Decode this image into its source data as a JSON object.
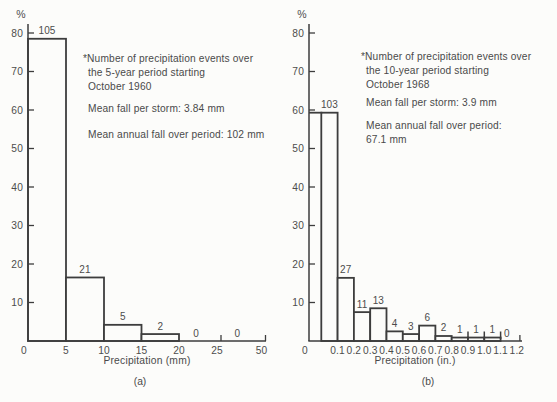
{
  "figure": {
    "background": "#fcfcfa",
    "line_color": "#3d3d3d",
    "text_color": "#4c4c4c"
  },
  "chart_data": [
    {
      "type": "bar",
      "panel": "a",
      "caption": "(a)",
      "y_unit_label": "%",
      "xlabel": "Precipitation (mm)",
      "ylim": [
        0,
        80
      ],
      "yticks": [
        10,
        20,
        30,
        40,
        50,
        60,
        70,
        80
      ],
      "origin_label": "0",
      "xtick_labels": [
        "5",
        "10",
        "15",
        "20",
        "25",
        "50"
      ],
      "axis_note": "x-axis compressed between 25 and 50",
      "bins": [
        {
          "range": "0-5",
          "count": 105,
          "pct": 78.5
        },
        {
          "range": "5-10",
          "count": 21,
          "pct": 16.5
        },
        {
          "range": "10-15",
          "count": 5,
          "pct": 4.2
        },
        {
          "range": "15-20",
          "count": 2,
          "pct": 1.8
        },
        {
          "range": "20-25",
          "count": 0,
          "pct": 0
        },
        {
          "range": "25-50",
          "count": 0,
          "pct": 0
        }
      ],
      "annotation": {
        "note_lines": [
          "*Number of precipitation events over",
          "the 5-year period starting",
          "October 1960"
        ],
        "mean_fall": "Mean fall per storm: 3.84 mm",
        "mean_annual_lines": [
          "Mean annual fall over period: 102 mm"
        ]
      }
    },
    {
      "type": "bar",
      "panel": "b",
      "caption": "(b)",
      "y_unit_label": "%",
      "xlabel": "Precipitation (in.)",
      "ylim": [
        0,
        80
      ],
      "yticks": [
        10,
        20,
        30,
        40,
        50,
        60,
        70,
        80
      ],
      "origin_label": "0",
      "xtick_labels": [
        "0.1",
        "0.2",
        "0.3",
        "0.4",
        "0.5",
        "0.6",
        "0.7",
        "0.8",
        "0.9",
        "1.0",
        "1.1",
        "1.2"
      ],
      "axis_note": "",
      "bins": [
        {
          "range": "0-0.1",
          "count": 103,
          "pct": 59.3
        },
        {
          "range": "0.1-0.2",
          "count": 27,
          "pct": 16.4
        },
        {
          "range": "0.2-0.3",
          "count": 11,
          "pct": 7.5
        },
        {
          "range": "0.3-0.4",
          "count": 13,
          "pct": 8.5
        },
        {
          "range": "0.4-0.5",
          "count": 4,
          "pct": 2.5
        },
        {
          "range": "0.5-0.6",
          "count": 3,
          "pct": 1.8
        },
        {
          "range": "0.6-0.7",
          "count": 6,
          "pct": 4.0
        },
        {
          "range": "0.7-0.8",
          "count": 2,
          "pct": 1.3
        },
        {
          "range": "0.8-0.9",
          "count": 1,
          "pct": 0.9
        },
        {
          "range": "0.9-1.0",
          "count": 1,
          "pct": 0.9
        },
        {
          "range": "1.0-1.1",
          "count": 1,
          "pct": 0.9
        },
        {
          "range": "1.1-1.2",
          "count": 0,
          "pct": 0
        }
      ],
      "annotation": {
        "note_lines": [
          "*Number of precipitation events over",
          "the 10-year period starting",
          "October 1968"
        ],
        "mean_fall": "Mean fall per storm: 3.9 mm",
        "mean_annual_lines": [
          "Mean annual fall over period:",
          "67.1 mm"
        ]
      }
    }
  ]
}
